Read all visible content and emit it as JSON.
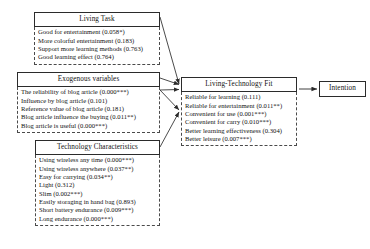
{
  "diagram": {
    "type": "path-model",
    "nodes": {
      "living_task": {
        "title": "Living Task",
        "items": [
          "Good for entertainment (0.058*)",
          "More colorful entertainment (0.183)",
          "Support more learning methods (0.763)",
          "Good learning effect (0.764)"
        ]
      },
      "exogenous": {
        "title": "Exogenous variables",
        "items": [
          "The reliability of blog article (0.000***)",
          "Influence by blog article (0.101)",
          "Reference value of blog article (0.181)",
          "Blog article influence the buying (0.011**)",
          "Blog article is useful (0.000***)"
        ]
      },
      "technology_characteristics": {
        "title": "Technology Characteristics",
        "items": [
          "Using wireless any time (0.000***)",
          "Using wireless anywhere (0.037**)",
          "Easy for carrying (0.034**)",
          "Light (0.312)",
          "Slim (0.002***)",
          "Easily storaging in hand bag (0.893)",
          "Short battery endurance (0.009***)",
          "Long endurance (0.000***)"
        ]
      },
      "fit": {
        "title": "Living-Technology Fit",
        "items": [
          "Reliable for learning (0.111)",
          "Reliable for entertainment (0.011**)",
          "Convenient for use (0.001***)",
          "Convenient for carry (0.010***)",
          "Better learning effectiveness (0.304)",
          "Better leisure (0.007***)"
        ]
      },
      "intention": {
        "title": "Intention",
        "items": []
      }
    },
    "edges": [
      {
        "from": "living_task",
        "to": "fit"
      },
      {
        "from": "exogenous",
        "to": "fit"
      },
      {
        "from": "technology_characteristics",
        "to": "fit"
      },
      {
        "from": "fit",
        "to": "intention"
      }
    ],
    "colors": {
      "line": "#2b2b2b",
      "box_border": "#2b2b2b",
      "items_border": "#4a4a4a",
      "background": "#ffffff"
    }
  }
}
